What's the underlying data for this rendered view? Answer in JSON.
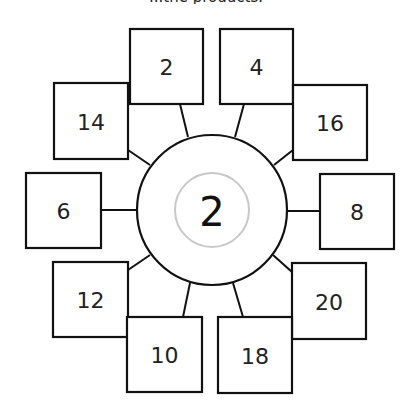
{
  "caption": "...the products.",
  "hub": {
    "value": "2",
    "cx": 212,
    "cy": 210,
    "r": 75,
    "inner_r": 37,
    "inner_color": "#c8c8c8"
  },
  "boxes": [
    {
      "id": "top-left",
      "value": "2",
      "x": 130,
      "y": 29,
      "w": 73,
      "h": 75,
      "lx1": 180,
      "ly1": 104,
      "lx2": 188,
      "ly2": 137
    },
    {
      "id": "top-right",
      "value": "4",
      "x": 220,
      "y": 29,
      "w": 73,
      "h": 75,
      "lx1": 244,
      "ly1": 104,
      "lx2": 235,
      "ly2": 137
    },
    {
      "id": "upper-left",
      "value": "14",
      "x": 54,
      "y": 83,
      "w": 74,
      "h": 76,
      "lx1": 128,
      "ly1": 150,
      "lx2": 150,
      "ly2": 165
    },
    {
      "id": "upper-right",
      "value": "16",
      "x": 293,
      "y": 85,
      "w": 74,
      "h": 75,
      "lx1": 293,
      "ly1": 150,
      "lx2": 274,
      "ly2": 165
    },
    {
      "id": "left",
      "value": "6",
      "x": 26,
      "y": 173,
      "w": 75,
      "h": 75,
      "lx1": 101,
      "ly1": 210,
      "lx2": 137,
      "ly2": 210
    },
    {
      "id": "right",
      "value": "8",
      "x": 320,
      "y": 174,
      "w": 74,
      "h": 75,
      "lx1": 287,
      "ly1": 211,
      "lx2": 320,
      "ly2": 211
    },
    {
      "id": "lower-left",
      "value": "12",
      "x": 53,
      "y": 262,
      "w": 75,
      "h": 75,
      "lx1": 128,
      "ly1": 270,
      "lx2": 150,
      "ly2": 255
    },
    {
      "id": "lower-right",
      "value": "20",
      "x": 292,
      "y": 263,
      "w": 74,
      "h": 76,
      "lx1": 292,
      "ly1": 272,
      "lx2": 273,
      "ly2": 255
    },
    {
      "id": "bottom-left",
      "value": "10",
      "x": 127,
      "y": 317,
      "w": 75,
      "h": 75,
      "lx1": 183,
      "ly1": 317,
      "lx2": 190,
      "ly2": 283
    },
    {
      "id": "bottom-right",
      "value": "18",
      "x": 218,
      "y": 317,
      "w": 74,
      "h": 76,
      "lx1": 243,
      "ly1": 317,
      "lx2": 233,
      "ly2": 283
    }
  ]
}
